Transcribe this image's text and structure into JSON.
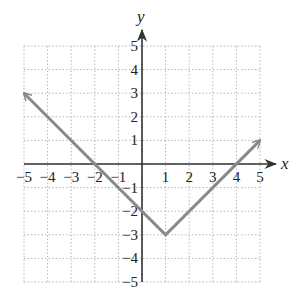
{
  "chart_data": {
    "type": "line",
    "title": "",
    "xlabel": "x",
    "ylabel": "y",
    "xlim": [
      -5,
      5
    ],
    "ylim": [
      -5,
      5
    ],
    "grid": true,
    "x_ticks": [
      "-5",
      "-4",
      "-3",
      "-2",
      "-1",
      "1",
      "2",
      "3",
      "4",
      "5"
    ],
    "y_ticks": [
      "5",
      "4",
      "3",
      "2",
      "1",
      "-1",
      "-2",
      "-3",
      "-4",
      "-5"
    ],
    "series": [
      {
        "name": "y = |x - 1| - 3",
        "points": [
          [
            -5,
            3
          ],
          [
            1,
            -3
          ],
          [
            5,
            1
          ]
        ],
        "arrows": "both ends",
        "color": "#8a8a8a"
      }
    ],
    "key_points": {
      "vertex": [
        1,
        -3
      ],
      "y_intercept": [
        0,
        -2
      ],
      "x_intercepts": [
        [
          -2,
          0
        ],
        [
          4,
          0
        ]
      ]
    }
  },
  "colors": {
    "axis": "#333333",
    "grid": "#b8b8b8",
    "curve": "#8a8a8a"
  }
}
